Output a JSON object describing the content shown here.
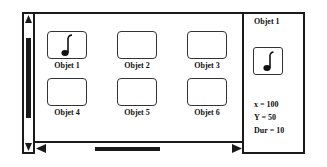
{
  "objects": [
    {
      "label": "Objet 1",
      "icon": "music-note-icon",
      "has_icon": true
    },
    {
      "label": "Objet 2",
      "has_icon": false
    },
    {
      "label": "Objet 3",
      "has_icon": false
    },
    {
      "label": "Objet 4",
      "has_icon": false
    },
    {
      "label": "Objet 5",
      "has_icon": false
    },
    {
      "label": "Objet 6",
      "has_icon": false
    }
  ],
  "detail": {
    "title": "Objet 1",
    "icon": "music-note-icon",
    "props": {
      "x": "x = 100",
      "y": "Y = 50",
      "dur": "Dur = 10"
    }
  },
  "colors": {
    "line": "#1a1a1a",
    "background": "#ffffff"
  }
}
